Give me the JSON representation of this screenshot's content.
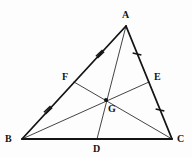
{
  "figure": {
    "width": 192,
    "height": 158,
    "background_color": "#fdfdfd",
    "stroke_color": "#141414",
    "side_stroke_width": 1.8,
    "cevian_stroke_width": 0.8,
    "tick_stroke_width": 1.5
  },
  "labels": {
    "A": "A",
    "B": "B",
    "C": "C",
    "D": "D",
    "E": "E",
    "F": "F",
    "G": "G"
  },
  "points": {
    "A": {
      "name": "A",
      "x": 126,
      "y": 26
    },
    "B": {
      "name": "B",
      "x": 22,
      "y": 139
    },
    "C": {
      "name": "C",
      "x": 172,
      "y": 139
    },
    "D": {
      "name": "D",
      "x": 97,
      "y": 139
    },
    "E": {
      "name": "E",
      "x": 149,
      "y": 82
    },
    "F": {
      "name": "F",
      "x": 74,
      "y": 82
    },
    "G": {
      "name": "G",
      "x": 106,
      "y": 100
    }
  },
  "label_positions": {
    "A": {
      "x": 122,
      "y": 10
    },
    "B": {
      "x": 5,
      "y": 134
    },
    "C": {
      "x": 177,
      "y": 134
    },
    "D": {
      "x": 93,
      "y": 144
    },
    "E": {
      "x": 154,
      "y": 72
    },
    "F": {
      "x": 62,
      "y": 72
    },
    "G": {
      "x": 108,
      "y": 104
    }
  },
  "sides": [
    {
      "name": "side-AB",
      "from": "A",
      "to": "B",
      "label": "AB"
    },
    {
      "name": "side-AC",
      "from": "A",
      "to": "C",
      "label": "AC"
    },
    {
      "name": "side-BC",
      "from": "B",
      "to": "C",
      "label": "BC"
    }
  ],
  "cevians": [
    {
      "name": "median-AD",
      "from": "A",
      "to": "D",
      "label": "AD"
    },
    {
      "name": "median-BE",
      "from": "B",
      "to": "E",
      "label": "BE"
    },
    {
      "name": "median-CF",
      "from": "C",
      "to": "F",
      "label": "CF"
    }
  ],
  "tick_marks": [
    {
      "name": "tick-AF",
      "segment": "AF",
      "count": 2,
      "x": 100,
      "y": 54,
      "angle": 47,
      "length": 9
    },
    {
      "name": "tick-FB",
      "segment": "FB",
      "count": 2,
      "x": 48,
      "y": 110,
      "angle": 47,
      "length": 9
    },
    {
      "name": "tick-AE",
      "segment": "AE",
      "count": 1,
      "x": 137,
      "y": 54,
      "angle": -76,
      "length": 9
    },
    {
      "name": "tick-EC",
      "segment": "EC",
      "count": 1,
      "x": 160,
      "y": 110,
      "angle": -76,
      "length": 9
    },
    {
      "name": "tick-BD",
      "segment": "BD",
      "count": 1,
      "x": 59,
      "y": 139,
      "angle": 90,
      "length": 9
    },
    {
      "name": "tick-DC",
      "segment": "DC",
      "count": 1,
      "x": 134,
      "y": 139,
      "angle": 90,
      "length": 9
    }
  ],
  "centroid_dot": {
    "name": "centroid-G",
    "x": 106,
    "y": 100,
    "radius": 2
  }
}
